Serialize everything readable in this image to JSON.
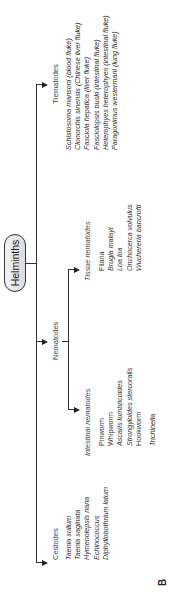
{
  "root": {
    "label": "Helminths"
  },
  "groups": {
    "cestodes": {
      "title": "Cestodes",
      "items": [
        "Taenia solium",
        "Taenia saginata",
        "Hymenolepsis nana",
        "Echinococcus",
        "Diphyllobothrium latum"
      ]
    },
    "nematodes": {
      "title": "Nematodes",
      "intestinal": {
        "title": "Intestinal nematodes",
        "items": [
          "Pinworm",
          "Whipworm",
          "Ascaris lumbricoides",
          "Strongyloides stercoralis",
          "Hookworm",
          "",
          "Trichinella"
        ]
      },
      "tissue": {
        "title": "Tissue nematodes",
        "items": [
          "Filaria",
          "Brugia malayi",
          "Loa loa",
          "Onchocerca volvulus",
          "Wuchereria bancrofti"
        ]
      }
    },
    "trematodes": {
      "title": "Trematodes",
      "items": [
        "Schistosoma mansoni (blood fluke)",
        "Clonorchis sinensis (Chinese liver fluke)",
        "Fasciola hepatica (liver fluke)",
        "Fasciolopsis buski (intestinal fluke)",
        "Heterophyes heterophyes (intestinal fluke)",
        "Paragonimus westermani (lung fluke)"
      ]
    }
  },
  "figure_label": "B"
}
